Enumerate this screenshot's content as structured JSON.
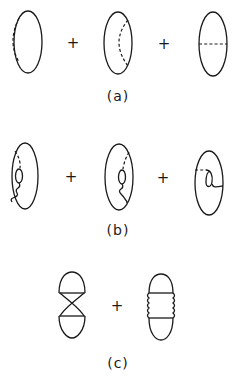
{
  "figure": {
    "stroke_color": "#1a1a1a",
    "background": "#ffffff",
    "rows": [
      {
        "id": "a",
        "label": "(a)",
        "operators": [
          "+",
          "+"
        ],
        "diagrams": [
          {
            "name": "ellipse-with-left-dashed-arc"
          },
          {
            "name": "ellipse-with-right-dashed-arc"
          },
          {
            "name": "ellipse-with-horizontal-dashed-chord"
          }
        ]
      },
      {
        "id": "b",
        "label": "(b)",
        "operators": [
          "+",
          "+"
        ],
        "diagrams": [
          {
            "name": "ellipse-with-left-loop-insertion"
          },
          {
            "name": "ellipse-with-right-loop-insertion"
          },
          {
            "name": "ellipse-with-tadpole-loop"
          }
        ]
      },
      {
        "id": "c",
        "label": "(c)",
        "operators": [
          "+"
        ],
        "diagrams": [
          {
            "name": "crossed-two-bubble-diagram"
          },
          {
            "name": "ladder-with-wavy-sides"
          }
        ]
      }
    ]
  }
}
